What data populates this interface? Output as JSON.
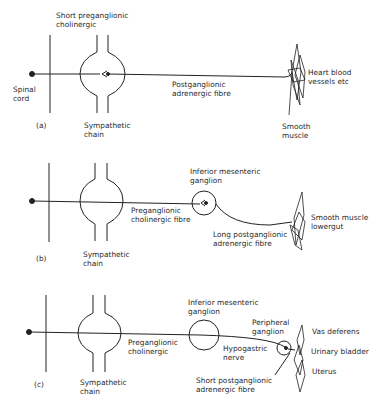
{
  "figure": {
    "panels": [
      {
        "id": "a",
        "tag": "(a)",
        "labels": {
          "preganglionic": "Short preganglionic\ncholinergic",
          "spinal_cord": "Spinal\ncord",
          "chain": "Sympathetic\nchain",
          "postganglionic": "Postganglionic\nadrenergic fibre",
          "target": "Heart blood\nvessels etc",
          "muscle": "Smooth\nmuscle"
        }
      },
      {
        "id": "b",
        "tag": "(b)",
        "labels": {
          "ganglion": "Inferior mesenteric\nganglion",
          "preganglionic": "Preganglionic\ncholinergic fibre",
          "postganglionic": "Long postganglionic\nadrenergic fibre",
          "target": "Smooth muscle\nlowergut",
          "chain": "Sympathetic\nchain"
        }
      },
      {
        "id": "c",
        "tag": "(c)",
        "labels": {
          "ganglion": "Inferior mesenteric\nganglion",
          "peripheral": "Peripheral\nganglion",
          "preganglionic": "Preganglionic\ncholinergic",
          "hypogastric": "Hypogastric\nnerve",
          "postganglionic": "Short postganglionic\nadrenergic fibre",
          "chain": "Sympathetic\nchain",
          "targets": [
            "Vas deferens",
            "Urinary bladder",
            "Uterus"
          ]
        }
      }
    ]
  }
}
